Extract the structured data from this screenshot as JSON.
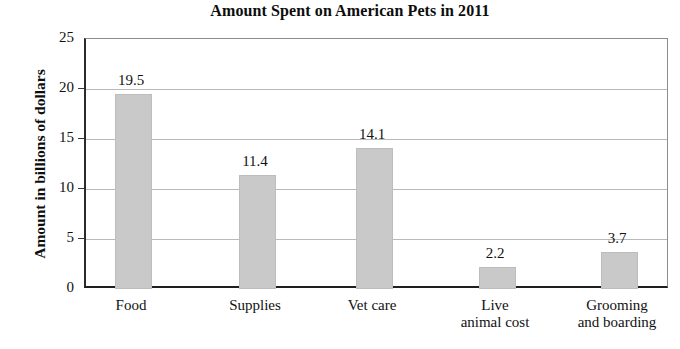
{
  "chart_data": {
    "type": "bar",
    "title": "Amount Spent on American Pets in 2011",
    "xlabel": "",
    "ylabel": "Amount in billions of dollars",
    "categories": [
      "Food",
      "Supplies",
      "Vet care",
      "Live animal cost",
      "Grooming and boarding"
    ],
    "category_lines": [
      [
        "Food",
        ""
      ],
      [
        "Supplies",
        ""
      ],
      [
        "Vet care",
        ""
      ],
      [
        "Live",
        "animal cost"
      ],
      [
        "Grooming",
        "and boarding"
      ]
    ],
    "values": [
      19.5,
      11.4,
      14.1,
      2.2,
      3.7
    ],
    "value_labels": [
      "19.5",
      "11.4",
      "14.1",
      "2.2",
      "3.7"
    ],
    "ylim": [
      0,
      25
    ],
    "ytick_labels": [
      "25",
      "20",
      "15",
      "10",
      "5",
      "0"
    ],
    "ytick_values": [
      25,
      20,
      15,
      10,
      5,
      0
    ],
    "grid": true,
    "legend": null,
    "units": "billions of dollars",
    "colors": {
      "bar_fill": "#c9c9c9",
      "bar_stroke": "#bdbdbd",
      "gridline": "#b9b9b9",
      "axis": "#1f1f1f",
      "text": "#111111",
      "background": "#ffffff"
    }
  }
}
